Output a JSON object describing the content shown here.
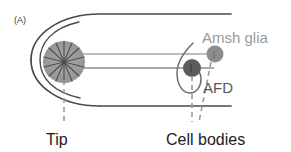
{
  "figure": {
    "panel_letter": "(A)",
    "background_color": "#ffffff"
  },
  "structures": {
    "head_outline": {
      "name": "head-outline",
      "color": "#4a4a4a"
    },
    "dendrite_tip": {
      "label": "dendrite-tip-microvilli",
      "fill_color": "#9b9b9b",
      "spoke_color": "#4f4f4f"
    },
    "dendrites": {
      "label": "dendrite-processes",
      "upper_color": "#a8a8a8",
      "lower_color": "#8c8c8c"
    },
    "glia_cell_body": {
      "label": "Amsh glia",
      "color": "#8d8d8d"
    },
    "neuron_cell_body": {
      "label": "AFD",
      "color": "#5c5c5c"
    },
    "glia_sheath": {
      "label": "glia-sheath-hook",
      "color": "#6e6e6e"
    }
  },
  "annotations": {
    "glia_label": "Amsh glia",
    "neuron_label": "AFD",
    "tip_label": "Tip",
    "cell_bodies_label": "Cell bodies"
  },
  "leader_lines": {
    "tip_leader_color": "#9a9a9a",
    "cell_bodies_leader_color": "#9a9a9a",
    "style": "dashed"
  }
}
